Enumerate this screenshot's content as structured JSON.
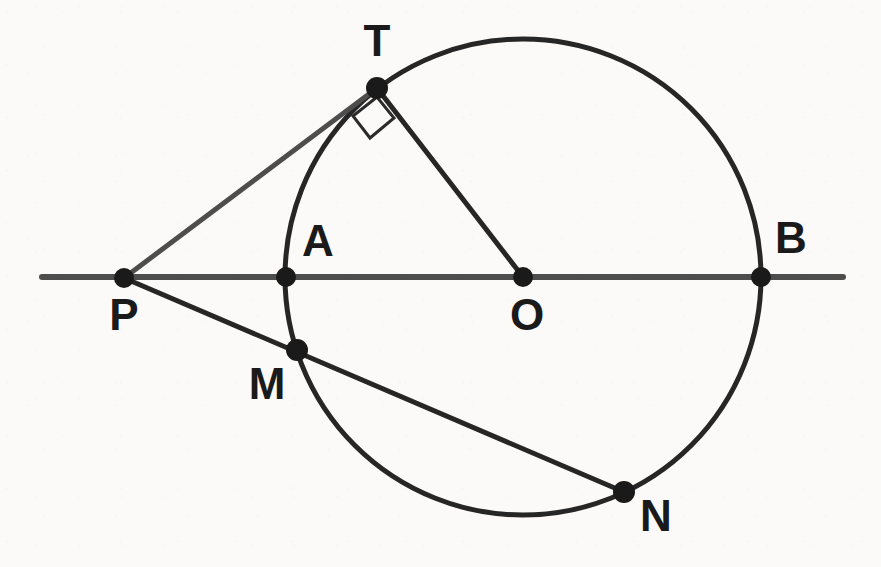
{
  "figure": {
    "kind": "geometry-diagram",
    "canvas": {
      "width": 881,
      "height": 567
    },
    "background_color": "#fbfaf8",
    "ink_color": "#262626",
    "secondary_ink_color": "#4d4d4d",
    "circle": {
      "name": "main-circle",
      "center_label": "O",
      "cx": 523,
      "cy": 277,
      "r": 238,
      "stroke_width": 5
    },
    "points": [
      {
        "id": "P",
        "label": "P",
        "x": 124,
        "y": 278,
        "label_x": 124,
        "label_y": 318,
        "dot_r": 10
      },
      {
        "id": "T",
        "label": "T",
        "x": 377,
        "y": 88,
        "label_x": 377,
        "label_y": 44,
        "dot_r": 11
      },
      {
        "id": "A",
        "label": "A",
        "x": 286,
        "y": 277,
        "label_x": 318,
        "label_y": 244,
        "dot_r": 10
      },
      {
        "id": "O",
        "label": "O",
        "x": 523,
        "y": 277,
        "label_x": 527,
        "label_y": 318,
        "dot_r": 10
      },
      {
        "id": "B",
        "label": "B",
        "x": 761,
        "y": 277,
        "label_x": 791,
        "label_y": 241,
        "dot_r": 10
      },
      {
        "id": "M",
        "label": "M",
        "x": 297,
        "y": 350,
        "label_x": 267,
        "label_y": 387,
        "dot_r": 11
      },
      {
        "id": "N",
        "label": "N",
        "x": 624,
        "y": 492,
        "label_x": 656,
        "label_y": 519,
        "dot_r": 11
      }
    ],
    "segments": [
      {
        "id": "line-PB",
        "name": "secant-line-through-A-O-B",
        "x1": 42,
        "y1": 277,
        "x2": 843,
        "y2": 277,
        "stroke_width": 6,
        "color": "#3c3c3c"
      },
      {
        "id": "seg-PT",
        "name": "tangent-segment-PT",
        "x1": 124,
        "y1": 278,
        "x2": 377,
        "y2": 88,
        "stroke_width": 5,
        "color": "#4d4d4d"
      },
      {
        "id": "seg-TO",
        "name": "radius-segment-TO",
        "x1": 377,
        "y1": 88,
        "x2": 523,
        "y2": 277,
        "stroke_width": 5,
        "color": "#262626"
      },
      {
        "id": "seg-PN",
        "name": "secant-segment-P-M-N",
        "x1": 124,
        "y1": 278,
        "x2": 624,
        "y2": 492,
        "stroke_width": 5,
        "color": "#262626"
      }
    ],
    "right_angle_marker": {
      "name": "right-angle-at-T",
      "vertex": "T",
      "size": 26,
      "points": "377,97 353,116 370,138 394,118"
    },
    "labels": {
      "P": "P",
      "T": "T",
      "A": "A",
      "O": "O",
      "B": "B",
      "M": "M",
      "N": "N"
    }
  }
}
